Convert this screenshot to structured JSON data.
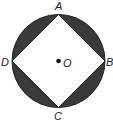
{
  "diagram": {
    "colors": {
      "shaded": "#3a3a3a",
      "outline": "#222222",
      "fill": "#ffffff"
    },
    "circle": {
      "center": "O",
      "cx": 58.5,
      "cy": 61,
      "r": 46.5
    },
    "points": [
      {
        "name": "A",
        "x": 58.5,
        "y": 14.5,
        "label_x": 55,
        "label_y": 10
      },
      {
        "name": "B",
        "x": 105,
        "y": 61,
        "label_x": 106,
        "label_y": 66
      },
      {
        "name": "C",
        "x": 58.5,
        "y": 107.5,
        "label_x": 54,
        "label_y": 120
      },
      {
        "name": "D",
        "x": 12,
        "y": 61,
        "label_x": 1,
        "label_y": 66
      }
    ],
    "center_label": {
      "name": "O",
      "x": 63,
      "y": 67
    },
    "shaded_regions": "circle minus inscribed square"
  }
}
